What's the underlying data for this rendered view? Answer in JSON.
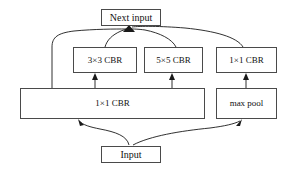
{
  "diagram": {
    "background_color": "#ffffff",
    "box_border_color": "#4a4a4a",
    "edge_color": "#1a1a1a",
    "text_color": "#111111",
    "nodes": {
      "next_input": {
        "label": "Next input",
        "x": 101,
        "y": 9,
        "w": 60,
        "h": 17,
        "font_size": 10
      },
      "conv3x3": {
        "label": "3×3 CBR",
        "x": 73,
        "y": 47,
        "w": 64,
        "h": 26,
        "font_size": 9
      },
      "conv5x5": {
        "label": "5×5 CBR",
        "x": 144,
        "y": 47,
        "w": 59,
        "h": 26,
        "font_size": 9
      },
      "conv1x1_right": {
        "label": "1×1 CBR",
        "x": 216,
        "y": 47,
        "w": 61,
        "h": 26,
        "font_size": 9
      },
      "conv1x1_wide": {
        "label": "1×1 CBR",
        "x": 20,
        "y": 88,
        "w": 185,
        "h": 31,
        "font_size": 9
      },
      "max_pool": {
        "label": "max pool",
        "x": 216,
        "y": 88,
        "w": 61,
        "h": 31,
        "font_size": 9
      },
      "input": {
        "label": "Input",
        "x": 101,
        "y": 146,
        "w": 60,
        "h": 17,
        "font_size": 10
      }
    },
    "edges": [
      {
        "id": "input-to-conv1x1-wide",
        "from": "input",
        "to": "conv1x1_wide",
        "style": "curved-arrow"
      },
      {
        "id": "input-to-max-pool",
        "from": "input",
        "to": "max_pool",
        "style": "curved-arrow"
      },
      {
        "id": "conv1x1-wide-to-conv3x3",
        "from": "conv1x1_wide",
        "to": "conv3x3",
        "style": "straight-arrow"
      },
      {
        "id": "conv1x1-wide-to-conv5x5",
        "from": "conv1x1_wide",
        "to": "conv5x5",
        "style": "straight-arrow"
      },
      {
        "id": "max-pool-to-conv1x1-right",
        "from": "max_pool",
        "to": "conv1x1_right",
        "style": "straight-arrow"
      },
      {
        "id": "conv1x1-wide-to-next-input",
        "from": "conv1x1_wide",
        "to": "next_input",
        "style": "curved-arrow"
      },
      {
        "id": "conv3x3-to-next-input",
        "from": "conv3x3",
        "to": "next_input",
        "style": "curved-arrow"
      },
      {
        "id": "conv5x5-to-next-input",
        "from": "conv5x5",
        "to": "next_input",
        "style": "curved-arrow"
      },
      {
        "id": "conv1x1-right-to-next-input",
        "from": "conv1x1_right",
        "to": "next_input",
        "style": "curved-arrow"
      }
    ]
  }
}
